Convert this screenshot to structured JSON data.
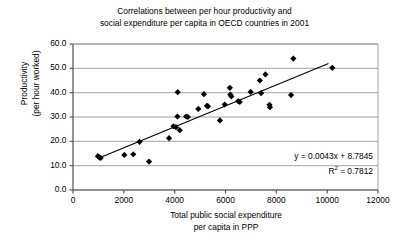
{
  "chart_data": {
    "type": "scatter",
    "title": "Correlations between per hour productivity and social expenditure per capita in OECD countries in 2001",
    "title_lines": [
      "Correlations between per hour productivity and",
      "social expenditure per capita in OECD countries in 2001"
    ],
    "xlabel": "Total public social expenditure per capita in PPP",
    "xlabel_lines": [
      "Total public social expenditure",
      "per capita in PPP"
    ],
    "ylabel": "Productivity (per hour worked)",
    "ylabel_lines": [
      "Productivity",
      "(per hour worked)"
    ],
    "xlim": [
      0,
      12000
    ],
    "ylim": [
      0.0,
      60.0
    ],
    "xticks": [
      0,
      2000,
      4000,
      6000,
      8000,
      10000,
      12000
    ],
    "xtick_labels": [
      "0",
      "2000",
      "4000",
      "6000",
      "8000",
      "10000",
      "12000"
    ],
    "yticks": [
      0.0,
      10.0,
      20.0,
      30.0,
      40.0,
      50.0,
      60.0
    ],
    "ytick_labels": [
      "0.0",
      "10.0",
      "20.0",
      "30.0",
      "40.0",
      "50.0",
      "60.0"
    ],
    "grid": "horizontal",
    "legend": "none",
    "marker": "diamond",
    "marker_color": "#000000",
    "marker_size": 5,
    "points": [
      {
        "x": 980,
        "y": 13.9
      },
      {
        "x": 1040,
        "y": 13.4
      },
      {
        "x": 1090,
        "y": 13.2
      },
      {
        "x": 2020,
        "y": 14.4
      },
      {
        "x": 2370,
        "y": 14.7
      },
      {
        "x": 2620,
        "y": 19.8
      },
      {
        "x": 2990,
        "y": 11.7
      },
      {
        "x": 3780,
        "y": 21.3
      },
      {
        "x": 3950,
        "y": 26.2
      },
      {
        "x": 4050,
        "y": 25.8
      },
      {
        "x": 4110,
        "y": 30.2
      },
      {
        "x": 4120,
        "y": 40.2
      },
      {
        "x": 4200,
        "y": 24.6
      },
      {
        "x": 4450,
        "y": 30.2
      },
      {
        "x": 4520,
        "y": 30.0
      },
      {
        "x": 4930,
        "y": 33.3
      },
      {
        "x": 5150,
        "y": 39.4
      },
      {
        "x": 5270,
        "y": 34.6
      },
      {
        "x": 5310,
        "y": 34.4
      },
      {
        "x": 5780,
        "y": 28.6
      },
      {
        "x": 5970,
        "y": 35.1
      },
      {
        "x": 6170,
        "y": 42.0
      },
      {
        "x": 6190,
        "y": 39.2
      },
      {
        "x": 6230,
        "y": 38.5
      },
      {
        "x": 6500,
        "y": 36.5
      },
      {
        "x": 6560,
        "y": 36.2
      },
      {
        "x": 6990,
        "y": 40.3
      },
      {
        "x": 7350,
        "y": 45.0
      },
      {
        "x": 7400,
        "y": 39.8
      },
      {
        "x": 7570,
        "y": 47.5
      },
      {
        "x": 7730,
        "y": 35.0
      },
      {
        "x": 7750,
        "y": 34.0
      },
      {
        "x": 8580,
        "y": 39.0
      },
      {
        "x": 8670,
        "y": 54.0
      },
      {
        "x": 10200,
        "y": 50.2
      }
    ],
    "trendline": {
      "slope": 0.0043,
      "intercept": 8.7845,
      "r_squared": 0.7812,
      "equation_text": "y = 0.0043x + 8.7845",
      "r2_text_prefix": "R",
      "r2_text_suffix": " = 0.7812",
      "r2_exponent": "2",
      "x_start": 1000,
      "x_end": 10050
    }
  }
}
